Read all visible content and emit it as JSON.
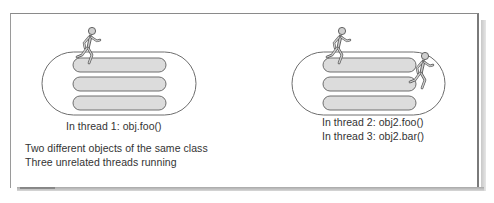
{
  "diagram": {
    "left_object": {
      "lanes": 3,
      "runners": 1,
      "caption": "In thread 1: obj.foo()"
    },
    "right_object": {
      "lanes": 3,
      "runners": 2,
      "captions": [
        "In thread 2: obj2.foo()",
        "In thread 3: obj2.bar()"
      ]
    },
    "notes": [
      "Two different objects of the same class",
      "Three unrelated threads running"
    ],
    "colors": {
      "oval_stroke": "#6e6e6e",
      "lane_fill": "#dcdcdc",
      "lane_stroke": "#6e6e6e",
      "runner_fill": "#cfcfcf",
      "runner_stroke": "#555555",
      "frame": "#8a8a8a"
    }
  }
}
